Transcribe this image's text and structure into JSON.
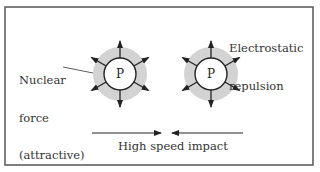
{
  "frame": {
    "x": 5,
    "y": 7,
    "w": 308,
    "h": 158,
    "stroke": "#555555"
  },
  "colors": {
    "halo": "#d3d3d3",
    "ink": "#222222",
    "text": "#333333"
  },
  "protons": [
    {
      "label": "P",
      "cx": 120,
      "cy": 74,
      "core_r": 16,
      "halo_r": 27
    },
    {
      "label": "P",
      "cx": 211,
      "cy": 74,
      "core_r": 16,
      "halo_r": 27
    }
  ],
  "force_arrows": {
    "count_per_proton": 6,
    "angles_deg": [
      -90,
      90,
      -30,
      30,
      150,
      210
    ],
    "inner_r": 16,
    "outer_r": 33
  },
  "labels": {
    "nuclear_force": [
      "Nuclear",
      "force",
      "(attractive)"
    ],
    "electrostatic": [
      "Electrostatic",
      "repulsion"
    ],
    "impact": "High speed impact"
  },
  "impact_arrows": {
    "left": {
      "x1": 92,
      "x2": 161,
      "y": 133
    },
    "right": {
      "x1": 243,
      "x2": 172,
      "y": 133
    }
  }
}
